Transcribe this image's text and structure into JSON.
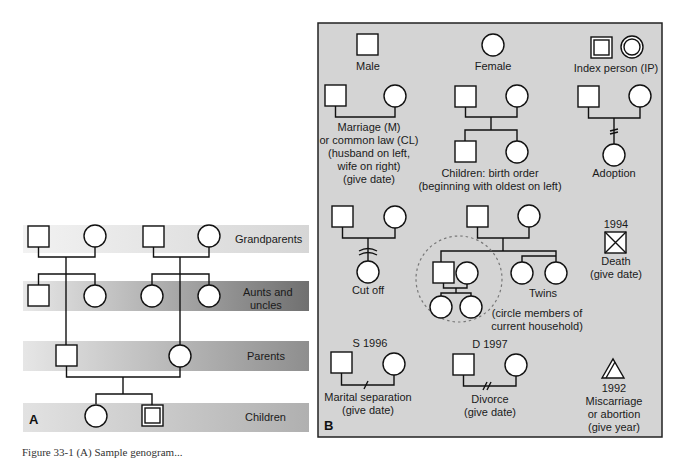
{
  "panel_a": {
    "letter": "A",
    "bands": [
      {
        "label": "Grandparents"
      },
      {
        "label_line1": "Aunts and",
        "label_line2": "uncles"
      },
      {
        "label": "Parents"
      },
      {
        "label": "Children"
      }
    ]
  },
  "panel_b": {
    "letter": "B",
    "legend": {
      "male": "Male",
      "female": "Female",
      "index_person": "Index person (IP)",
      "marriage": [
        "Marriage (M)",
        "or common law (CL)",
        "(husband on left,",
        "wife on right)",
        "(give date)"
      ],
      "children": [
        "Children: birth order",
        "(beginning with oldest on left)"
      ],
      "adoption": "Adoption",
      "cut_off": "Cut off",
      "twins": "Twins",
      "household": [
        "(circle members of",
        "current household)"
      ],
      "death_year": "1994",
      "death": [
        "Death",
        "(give date)"
      ],
      "separation_date": "S 1996",
      "separation": [
        "Marital separation",
        "(give date)"
      ],
      "divorce_date": "D 1997",
      "divorce": [
        "Divorce",
        "(give date)"
      ],
      "miscarriage_year": "1992",
      "miscarriage": [
        "Miscarriage",
        "or abortion",
        "(give year)"
      ]
    }
  },
  "caption": "Figure 33-1 (A) Sample genogram..."
}
